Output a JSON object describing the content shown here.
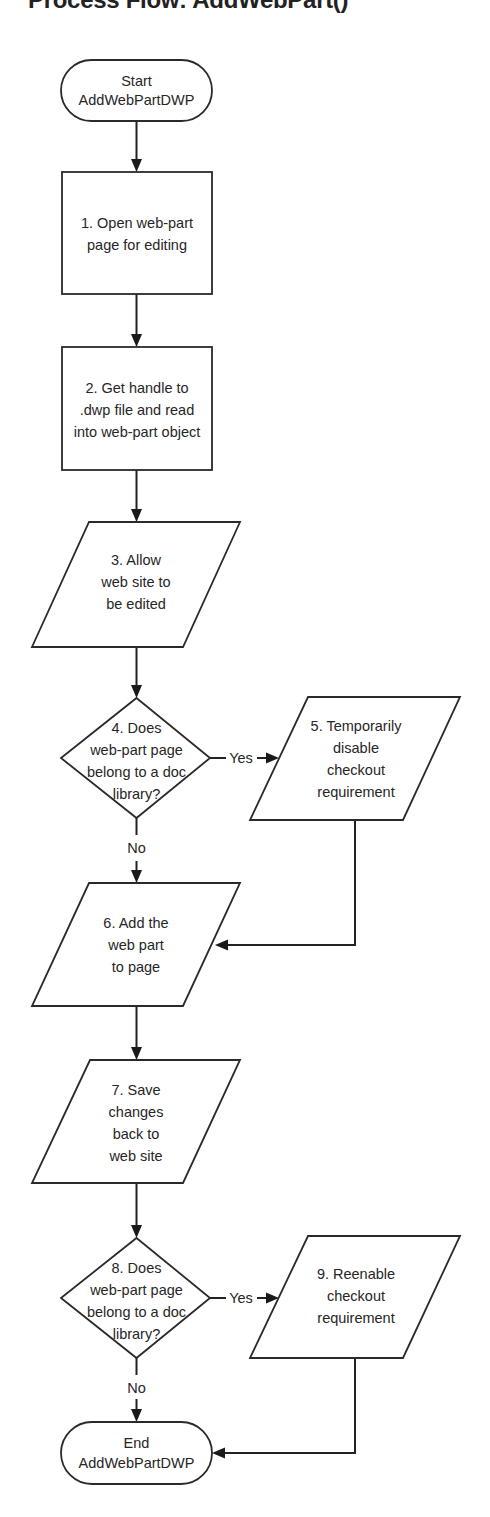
{
  "title": "Process Flow: AddWebPart()",
  "nodes": {
    "start": {
      "type": "terminal",
      "lines": [
        "Start",
        "AddWebPartDWP"
      ]
    },
    "step1": {
      "type": "process",
      "lines": [
        "1. Open web-part",
        "page for editing"
      ]
    },
    "step2": {
      "type": "process",
      "lines": [
        "2. Get handle to",
        ".dwp file and read",
        "into web-part object"
      ]
    },
    "step3": {
      "type": "io",
      "lines": [
        "3. Allow",
        "web site to",
        "be edited"
      ]
    },
    "step4": {
      "type": "decision",
      "lines": [
        "4. Does",
        "web-part page",
        "belong to a doc",
        "library?"
      ]
    },
    "step5": {
      "type": "io",
      "lines": [
        "5. Temporarily",
        "disable",
        "checkout",
        "requirement"
      ]
    },
    "step6": {
      "type": "io",
      "lines": [
        "6. Add the",
        "web part",
        "to page"
      ]
    },
    "step7": {
      "type": "io",
      "lines": [
        "7. Save",
        "changes",
        "back to",
        "web site"
      ]
    },
    "step8": {
      "type": "decision",
      "lines": [
        "8. Does",
        "web-part page",
        "belong to a doc",
        "library?"
      ]
    },
    "step9": {
      "type": "io",
      "lines": [
        "9. Reenable",
        "checkout",
        "requirement"
      ]
    },
    "end": {
      "type": "terminal",
      "lines": [
        "End",
        "AddWebPartDWP"
      ]
    }
  },
  "edge_labels": {
    "step4_yes": "Yes",
    "step4_no": "No",
    "step8_yes": "Yes",
    "step8_no": "No"
  },
  "edges": [
    {
      "from": "start",
      "to": "step1"
    },
    {
      "from": "step1",
      "to": "step2"
    },
    {
      "from": "step2",
      "to": "step3"
    },
    {
      "from": "step3",
      "to": "step4"
    },
    {
      "from": "step4",
      "to": "step5",
      "label": "Yes"
    },
    {
      "from": "step4",
      "to": "step6",
      "label": "No"
    },
    {
      "from": "step5",
      "to": "step6"
    },
    {
      "from": "step6",
      "to": "step7"
    },
    {
      "from": "step7",
      "to": "step8"
    },
    {
      "from": "step8",
      "to": "step9",
      "label": "Yes"
    },
    {
      "from": "step8",
      "to": "end",
      "label": "No"
    },
    {
      "from": "step9",
      "to": "end"
    }
  ]
}
